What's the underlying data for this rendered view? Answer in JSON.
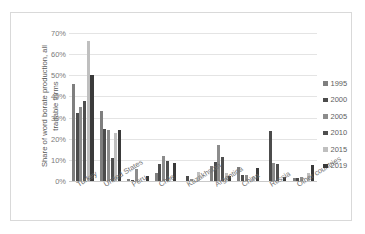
{
  "chart_data": {
    "type": "bar",
    "title": "",
    "xlabel": "",
    "ylabel": "Share of word borate production, all tradable forms",
    "ylim": [
      0,
      70
    ],
    "ytick_labels": [
      "0%",
      "10%",
      "20%",
      "30%",
      "40%",
      "50%",
      "60%",
      "70%"
    ],
    "ytick_values": [
      0,
      10,
      20,
      30,
      40,
      50,
      60,
      70
    ],
    "grid": true,
    "legend_position": "right",
    "categories": [
      "Turkey",
      "United States",
      "Peru",
      "Chile",
      "Kazakhstan",
      "Argentina",
      "China",
      "Russia",
      "Other countries"
    ],
    "series": [
      {
        "name": "1995",
        "color": "#7f7f7f",
        "values": [
          46,
          33,
          1,
          4,
          0,
          7,
          6.5,
          0,
          1.5
        ]
      },
      {
        "name": "2000",
        "color": "#4c4c4c",
        "values": [
          32,
          24.5,
          0.5,
          8,
          2.5,
          9,
          3,
          23.5,
          1.5
        ]
      },
      {
        "name": "2005",
        "color": "#8c8c8c",
        "values": [
          35,
          24,
          5.5,
          12,
          1,
          17,
          3,
          8.5,
          2
        ]
      },
      {
        "name": "2010",
        "color": "#4f4f4f",
        "values": [
          38,
          11,
          0,
          9.5,
          0,
          11.5,
          0,
          8,
          0
        ]
      },
      {
        "name": "2015",
        "color": "#bfbfbf",
        "values": [
          66,
          22.5,
          0,
          0,
          4.5,
          4,
          2,
          0,
          4
        ]
      },
      {
        "name": "2019",
        "color": "#3a3a3a",
        "values": [
          50,
          24,
          2.5,
          8.5,
          0,
          2.5,
          6,
          2,
          7.5
        ]
      }
    ]
  },
  "legend": {
    "items": [
      {
        "label": "1995",
        "color": "#7f7f7f"
      },
      {
        "label": "2000",
        "color": "#4c4c4c"
      },
      {
        "label": "2005",
        "color": "#8c8c8c"
      },
      {
        "label": "2010",
        "color": "#4f4f4f"
      },
      {
        "label": "2015",
        "color": "#bfbfbf"
      },
      {
        "label": "2019",
        "color": "#3a3a3a"
      }
    ]
  }
}
